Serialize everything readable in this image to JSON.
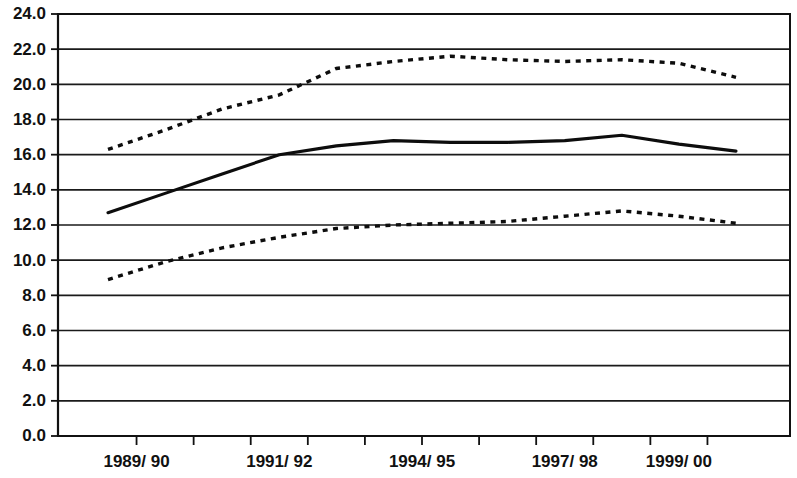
{
  "chart_data": {
    "type": "line",
    "title": "",
    "subtitle": "",
    "xlabel": "",
    "ylabel": "",
    "ylim": [
      0.0,
      24.0
    ],
    "y_ticks": [
      "0.0",
      "2.0",
      "4.0",
      "6.0",
      "8.0",
      "10.0",
      "12.0",
      "14.0",
      "16.0",
      "18.0",
      "20.0",
      "22.0",
      "24.0"
    ],
    "y_tick_values": [
      0.0,
      2.0,
      4.0,
      6.0,
      8.0,
      10.0,
      12.0,
      14.0,
      16.0,
      18.0,
      20.0,
      22.0,
      24.0
    ],
    "x_tick_labels": [
      "1989/ 90",
      "1991/ 92",
      "1994/ 95",
      "1997/ 98",
      "1999/ 00"
    ],
    "x_label_positions": [
      0.5,
      3.0,
      5.5,
      8.0,
      10.0
    ],
    "x": [
      0,
      1,
      2,
      3,
      4,
      5,
      6,
      7,
      8,
      9,
      10,
      11
    ],
    "grid": "horizontal",
    "legend": "none",
    "series": [
      {
        "name": "upper-bound",
        "style": "dashed",
        "values": [
          16.3,
          17.4,
          18.6,
          19.4,
          20.9,
          21.3,
          21.6,
          21.4,
          21.3,
          21.4,
          21.2,
          20.4
        ]
      },
      {
        "name": "central-estimate",
        "style": "solid",
        "values": [
          12.7,
          13.8,
          14.9,
          16.0,
          16.5,
          16.8,
          16.7,
          16.7,
          16.8,
          17.1,
          16.6,
          16.2
        ]
      },
      {
        "name": "lower-bound",
        "style": "dashed",
        "values": [
          8.9,
          9.9,
          10.7,
          11.3,
          11.8,
          12.0,
          12.1,
          12.2,
          12.5,
          12.8,
          12.5,
          12.1
        ]
      }
    ]
  }
}
